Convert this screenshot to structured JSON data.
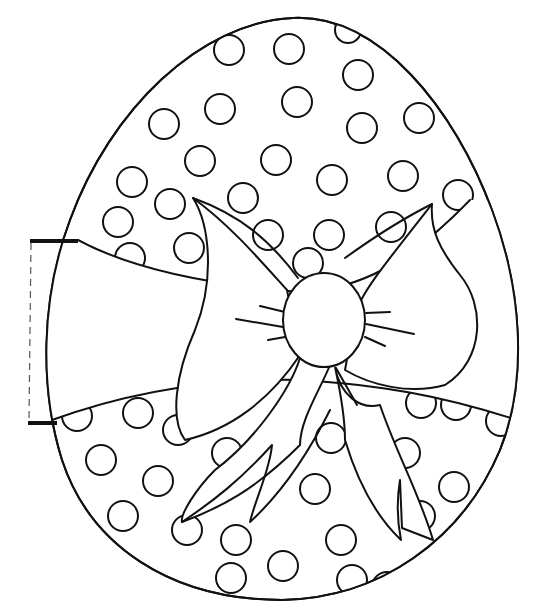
{
  "colors": {
    "line": "#111111",
    "paper": "#ffffff"
  },
  "egg": {
    "path": "M 293 18 C 380 14 455 110 492 210 C 522 290 528 380 500 450 C 462 540 380 598 282 600 C 170 600 90 545 62 460 C 40 390 40 300 70 220 C 110 110 200 22 293 18 Z"
  },
  "band": {
    "top": "M 78 240 C 130 268 210 285 300 292 C 360 290 410 262 470 200",
    "bottom": "M 52 420 C 120 395 200 378 300 380 C 380 385 440 395 517 420"
  },
  "tab": {
    "top_bar": {
      "x1": 30,
      "y1": 241,
      "x2": 78,
      "y2": 241
    },
    "bottom_bar": {
      "x1": 28,
      "y1": 423,
      "x2": 57,
      "y2": 423
    },
    "dash": {
      "x1": 31,
      "y1": 243,
      "x2": 29,
      "y2": 421
    }
  },
  "dots": [
    {
      "cx": 229,
      "cy": 50,
      "r": 15
    },
    {
      "cx": 289,
      "cy": 49,
      "r": 15
    },
    {
      "cx": 348,
      "cy": 30,
      "r": 13
    },
    {
      "cx": 358,
      "cy": 75,
      "r": 15
    },
    {
      "cx": 164,
      "cy": 124,
      "r": 15
    },
    {
      "cx": 220,
      "cy": 109,
      "r": 15
    },
    {
      "cx": 297,
      "cy": 102,
      "r": 15
    },
    {
      "cx": 362,
      "cy": 128,
      "r": 15
    },
    {
      "cx": 419,
      "cy": 118,
      "r": 15
    },
    {
      "cx": 200,
      "cy": 161,
      "r": 15
    },
    {
      "cx": 276,
      "cy": 160,
      "r": 15
    },
    {
      "cx": 332,
      "cy": 180,
      "r": 15
    },
    {
      "cx": 403,
      "cy": 176,
      "r": 15
    },
    {
      "cx": 132,
      "cy": 182,
      "r": 15
    },
    {
      "cx": 170,
      "cy": 204,
      "r": 15
    },
    {
      "cx": 243,
      "cy": 198,
      "r": 15
    },
    {
      "cx": 118,
      "cy": 222,
      "r": 15
    },
    {
      "cx": 268,
      "cy": 235,
      "r": 15
    },
    {
      "cx": 329,
      "cy": 235,
      "r": 15
    },
    {
      "cx": 391,
      "cy": 227,
      "r": 15
    },
    {
      "cx": 458,
      "cy": 195,
      "r": 15
    },
    {
      "cx": 130,
      "cy": 258,
      "r": 15
    },
    {
      "cx": 189,
      "cy": 248,
      "r": 15
    },
    {
      "cx": 308,
      "cy": 263,
      "r": 15
    },
    {
      "cx": 77,
      "cy": 416,
      "r": 15
    },
    {
      "cx": 138,
      "cy": 413,
      "r": 15
    },
    {
      "cx": 178,
      "cy": 430,
      "r": 15
    },
    {
      "cx": 101,
      "cy": 460,
      "r": 15
    },
    {
      "cx": 158,
      "cy": 481,
      "r": 15
    },
    {
      "cx": 123,
      "cy": 516,
      "r": 15
    },
    {
      "cx": 227,
      "cy": 453,
      "r": 15
    },
    {
      "cx": 187,
      "cy": 530,
      "r": 15
    },
    {
      "cx": 236,
      "cy": 540,
      "r": 15
    },
    {
      "cx": 231,
      "cy": 578,
      "r": 15
    },
    {
      "cx": 283,
      "cy": 566,
      "r": 15
    },
    {
      "cx": 315,
      "cy": 489,
      "r": 15
    },
    {
      "cx": 341,
      "cy": 540,
      "r": 15
    },
    {
      "cx": 352,
      "cy": 580,
      "r": 15
    },
    {
      "cx": 331,
      "cy": 438,
      "r": 15
    },
    {
      "cx": 405,
      "cy": 453,
      "r": 15
    },
    {
      "cx": 420,
      "cy": 516,
      "r": 15
    },
    {
      "cx": 421,
      "cy": 403,
      "r": 15
    },
    {
      "cx": 456,
      "cy": 405,
      "r": 15
    },
    {
      "cx": 501,
      "cy": 421,
      "r": 15
    },
    {
      "cx": 454,
      "cy": 487,
      "r": 15
    },
    {
      "cx": 387,
      "cy": 587,
      "r": 15
    }
  ],
  "bow": {
    "left_wing": "M 193 198 C 210 225 215 280 195 330 C 175 375 170 420 185 440 C 230 430 270 400 300 355 L 287 290 C 260 260 230 225 193 198 Z",
    "left_wing_inner": "M 193 198 C 240 215 270 240 298 278",
    "right_wing": "M 432 204 C 430 230 440 250 460 275 C 485 305 485 360 445 385 C 410 395 370 385 345 370 L 355 315 C 360 295 380 270 432 204 Z",
    "right_wing_inner": "M 432 204 C 400 220 370 240 345 258",
    "knot": {
      "cx": 324,
      "cy": 320,
      "rx": 41,
      "ry": 47
    },
    "left_ribbon": "M 300 358 C 290 390 255 440 215 470 C 195 490 180 515 182 522 C 220 508 255 490 300 445 C 300 420 320 390 330 365",
    "left_ribbon_notch": "M 182 522 C 215 500 240 480 272 445 C 270 470 255 500 250 522 C 285 490 310 450 330 410",
    "right_ribbon": "M 335 367 C 340 395 360 410 380 405 C 395 450 420 495 433 540 L 402 528 L 400 480 C 395 510 400 535 401 540 C 380 520 360 490 345 440 C 345 420 340 390 335 367",
    "whisker_left": [
      "M 236 319 L 283 327",
      "M 260 306 L 285 312",
      "M 268 340 L 285 337"
    ],
    "whisker_right": [
      "M 366 313 L 390 312",
      "M 366 324 L 414 334",
      "M 365 337 L 385 346",
      "M 336 368 L 357 405"
    ]
  }
}
